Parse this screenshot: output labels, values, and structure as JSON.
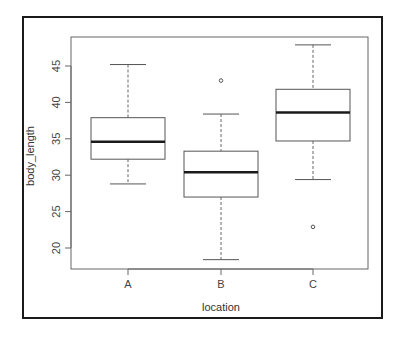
{
  "chart_data": {
    "type": "boxplot",
    "title": "",
    "xlabel": "location",
    "ylabel": "body_length",
    "categories": [
      "A",
      "B",
      "C"
    ],
    "ylim": [
      17,
      49
    ],
    "yticks": [
      20,
      25,
      30,
      35,
      40,
      45
    ],
    "grid": false,
    "legend": null,
    "boxes": [
      {
        "name": "A",
        "whisker_low": 28.8,
        "q1": 32.2,
        "median": 34.6,
        "q3": 37.9,
        "whisker_high": 45.2,
        "outliers": []
      },
      {
        "name": "B",
        "whisker_low": 18.4,
        "q1": 27.0,
        "median": 30.4,
        "q3": 33.3,
        "whisker_high": 38.4,
        "outliers": [
          43.0
        ]
      },
      {
        "name": "C",
        "whisker_low": 29.4,
        "q1": 34.7,
        "median": 38.6,
        "q3": 41.8,
        "whisker_high": 47.9,
        "outliers": [
          22.9
        ]
      }
    ]
  },
  "axes": {
    "x_title": "location",
    "y_title": "body_length",
    "x_tick_labels": [
      "A",
      "B",
      "C"
    ],
    "y_tick_labels": [
      "20",
      "25",
      "30",
      "35",
      "40",
      "45"
    ]
  },
  "colors": {
    "box_stroke": "#555555",
    "median": "#1a1a1a",
    "frame": "#1a1a1a",
    "text": "#444444"
  }
}
